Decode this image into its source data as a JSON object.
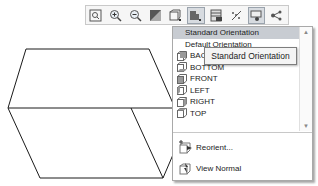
{
  "toolbar": {
    "buttons": [
      {
        "id": "zoom-to-fit",
        "icon": "zoom-to-fit-icon"
      },
      {
        "id": "zoom-in",
        "icon": "zoom-in-icon"
      },
      {
        "id": "zoom-out",
        "icon": "zoom-out-icon"
      },
      {
        "id": "section-view",
        "icon": "section-view-icon"
      },
      {
        "id": "view-orientation",
        "icon": "view-orientation-icon"
      },
      {
        "id": "standard-views",
        "icon": "standard-views-icon",
        "active": true
      },
      {
        "id": "display-style",
        "icon": "display-style-icon"
      },
      {
        "id": "hide-show",
        "icon": "hide-show-icon"
      },
      {
        "id": "view-settings",
        "icon": "view-settings-icon",
        "active": true
      },
      {
        "id": "apply-scene",
        "icon": "apply-scene-icon"
      }
    ]
  },
  "dropdown": {
    "items": [
      {
        "label": "Standard Orientation",
        "selected": true,
        "icon": null
      },
      {
        "label": "Default Orientation",
        "selected": false,
        "icon": null
      },
      {
        "label": "BACK",
        "icon": "back-view-icon"
      },
      {
        "label": "BOTTOM",
        "icon": "bottom-view-icon"
      },
      {
        "label": "FRONT",
        "icon": "front-view-icon"
      },
      {
        "label": "LEFT",
        "icon": "left-view-icon"
      },
      {
        "label": "RIGHT",
        "icon": "right-view-icon"
      },
      {
        "label": "TOP",
        "icon": "top-view-icon"
      }
    ],
    "actions": [
      {
        "label": "Reorient...",
        "icon": "reorient-icon"
      },
      {
        "label": "View Normal",
        "icon": "view-normal-icon"
      }
    ]
  },
  "tooltip": {
    "text": "Standard Orientation"
  },
  "colors": {
    "selected_bg": "#c8ccd2",
    "border": "#a9a9a9",
    "line": "#1a1a1a"
  }
}
